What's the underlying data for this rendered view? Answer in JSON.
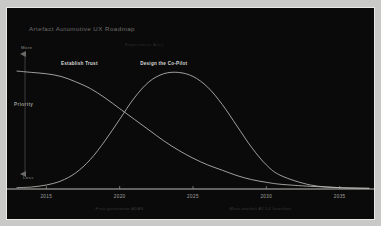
{
  "card": {
    "background": "#0a0a0a",
    "page_background": "#c9c9c7"
  },
  "chart_data": {
    "type": "line",
    "title": "Artefact Automotive UX Roadmap",
    "subtitle": "Experience Arcs",
    "xlabel": "",
    "ylabel": "Priority",
    "xlim": [
      2013,
      2037
    ],
    "ylim": [
      0,
      1
    ],
    "grid": false,
    "legend_position": "inline-annotations",
    "x_ticks": [
      "2015",
      "2020",
      "2025",
      "2030",
      "2035"
    ],
    "x_tick_values": [
      2015,
      2020,
      2025,
      2030,
      2035
    ],
    "y_axis_caps": {
      "high": "More",
      "low": "Less"
    },
    "series": [
      {
        "name": "Establish Trust",
        "color": "#b9b9b7",
        "label_x": 2016.0,
        "label_y": 0.92,
        "x": [
          2013.0,
          2014.0,
          2015.0,
          2016.0,
          2017.0,
          2018.0,
          2019.0,
          2020.0,
          2021.0,
          2022.0,
          2023.0,
          2024.0,
          2025.0,
          2026.0,
          2027.0,
          2028.0,
          2029.0,
          2030.0,
          2031.0,
          2033.0,
          2035.0,
          2037.0
        ],
        "y": [
          0.88,
          0.87,
          0.86,
          0.84,
          0.8,
          0.75,
          0.68,
          0.6,
          0.52,
          0.44,
          0.36,
          0.29,
          0.23,
          0.18,
          0.14,
          0.1,
          0.07,
          0.05,
          0.035,
          0.02,
          0.01,
          0.005
        ]
      },
      {
        "name": "Design the Co-Pilot",
        "color": "#b9b9b7",
        "label_x": 2021.4,
        "label_y": 0.92,
        "x": [
          2013.0,
          2014.0,
          2015.0,
          2016.0,
          2017.0,
          2018.0,
          2019.0,
          2020.0,
          2021.0,
          2022.0,
          2023.0,
          2024.0,
          2025.0,
          2026.0,
          2027.0,
          2028.0,
          2029.0,
          2030.0,
          2031.0,
          2033.0,
          2035.0,
          2037.0
        ],
        "y": [
          0.01,
          0.015,
          0.03,
          0.06,
          0.12,
          0.22,
          0.36,
          0.52,
          0.68,
          0.8,
          0.86,
          0.87,
          0.84,
          0.76,
          0.63,
          0.47,
          0.31,
          0.18,
          0.1,
          0.03,
          0.01,
          0.005
        ]
      }
    ],
    "annotations": [
      {
        "text": "First-generation ADAS",
        "x": 2020.0
      },
      {
        "text": "Mass-market AV L4 launches",
        "x": 2029.6
      }
    ]
  }
}
